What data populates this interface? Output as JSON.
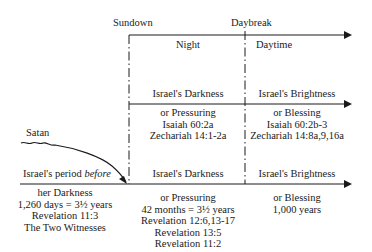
{
  "labels": {
    "sundown": "Sundown",
    "daybreak": "Daybreak",
    "night": "Night",
    "daytime": "Daytime",
    "satan": "Satan"
  },
  "middle_row": {
    "left": {
      "heading": "Israel's Darkness",
      "lines": [
        "or Pressuring",
        "Isaiah 60:2a",
        "Zechariah 14:1-2a"
      ]
    },
    "right": {
      "heading": "Israel's Brightness",
      "lines": [
        "or Blessing",
        "Isaiah 60:2b-3",
        "Zechariah 14:8a,9,16a"
      ]
    }
  },
  "bottom_row": {
    "before": {
      "heading_prefix": "Israel's period ",
      "heading_italic": "before",
      "lines": [
        "her Darkness",
        "1,260 days = 3½ years",
        "Revelation 11:3",
        "The Two Witnesses"
      ]
    },
    "darkness": {
      "heading": "Israel's Darkness",
      "lines": [
        "or Pressuring",
        "42 months = 3½ years",
        "Revelation 12:6,13-17",
        "Revelation 13:5",
        "Revelation 11:2"
      ]
    },
    "brightness": {
      "heading": "Israel's Brightness",
      "lines": [
        "or Blessing",
        "1,000 years"
      ]
    }
  },
  "colors": {
    "ink": "#1a1a1a",
    "background": "#ffffff"
  }
}
